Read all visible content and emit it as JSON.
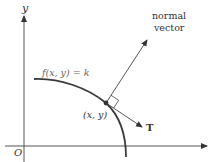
{
  "diagram": {
    "type": "level-curve-gradient",
    "axes": {
      "x_label": "",
      "y_label": "y",
      "origin_label": "O"
    },
    "curve_label": "f(x, y) = k",
    "point_label": "(x, y)",
    "normal_label_line1": "normal",
    "normal_label_line2": "vector",
    "tangent_label": "T",
    "colors": {
      "axis": "#555555",
      "curve": "#3a3a3a",
      "vector": "#444444",
      "point": "#333333",
      "text": "#333333",
      "curve_label": "#666666"
    }
  }
}
